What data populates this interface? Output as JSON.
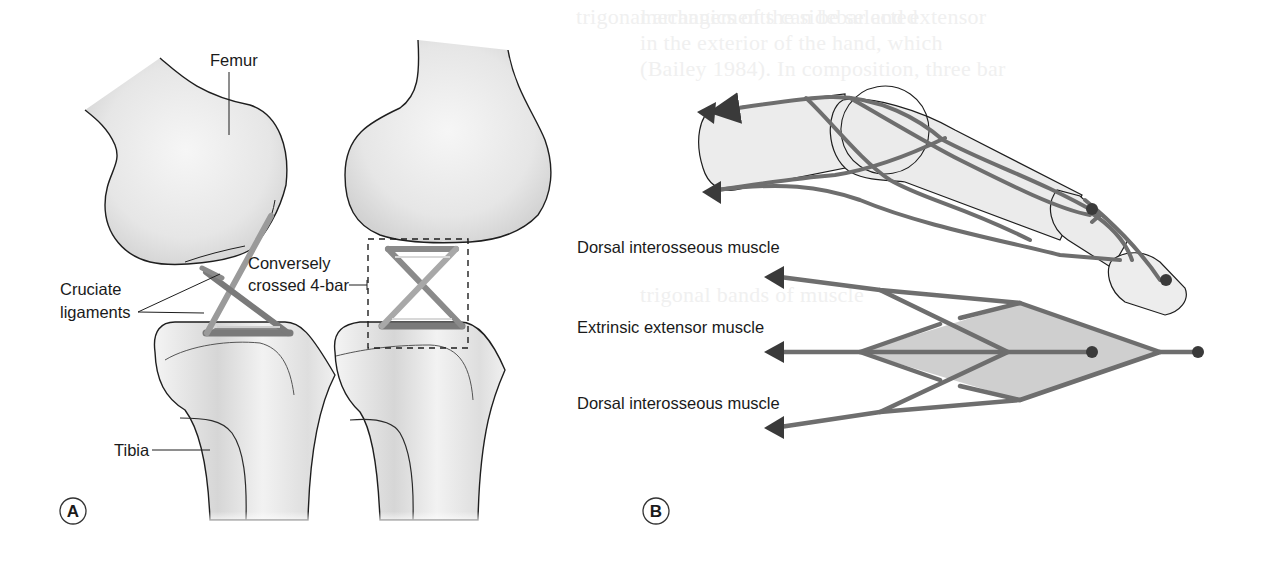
{
  "figure": {
    "panels": [
      {
        "id": "A",
        "letter": "A",
        "subject": "knee joint (sagittal and frontal views)",
        "labels": {
          "femur": "Femur",
          "cruciate_line1": "Cruciate",
          "cruciate_line2": "ligaments",
          "fourbar_line1": "Conversely",
          "fourbar_line2": "crossed 4-bar",
          "tibia": "Tibia"
        }
      },
      {
        "id": "B",
        "letter": "B",
        "subject": "finger extensor mechanism",
        "labels": {
          "dorsal_top": "Dorsal interosseous muscle",
          "extrinsic": "Extrinsic extensor muscle",
          "dorsal_bottom": "Dorsal interosseous muscle"
        }
      }
    ],
    "colors": {
      "bone_fill": "#ececec",
      "bone_shade": "#d4d4d4",
      "outline": "#1e1e1e",
      "ligament": "#7a7a7a",
      "ligament_light": "#b5b5b5",
      "tendon": "#6e6e6e",
      "arrowhead": "#3a3a3a",
      "rhombus_fill": "#cfcfcf",
      "dot": "#3a3a3a"
    }
  },
  "background_bleed_text": [
    "mechanics of the sidebar and extensor",
    "in the exterior of the hand, which",
    "(Bailey 1984). In composition, three bar",
    "trigonal arrangements can be selected",
    "trigonal bands of muscle"
  ]
}
